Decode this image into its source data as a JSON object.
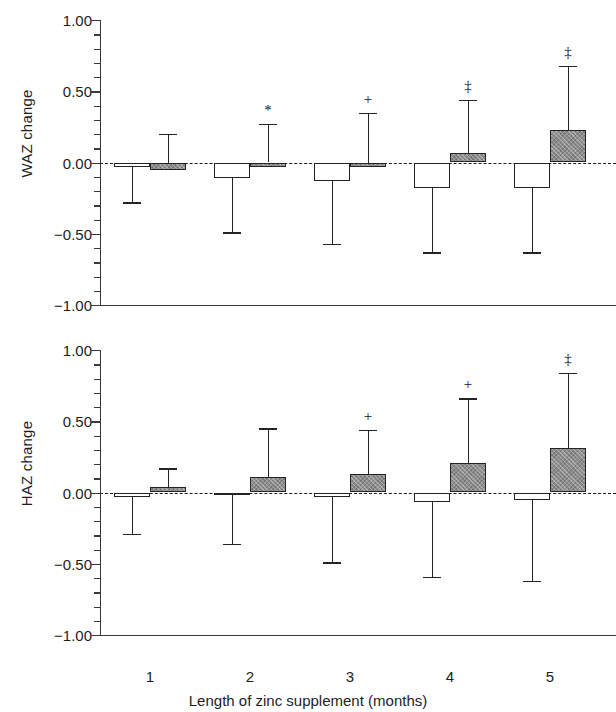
{
  "chart_data": [
    {
      "type": "bar",
      "panel_id": "waz",
      "title": "",
      "ylabel": "WAZ change",
      "xlabel": "",
      "ylim": [
        -1.0,
        1.0
      ],
      "ytick_labels": [
        "1.00",
        "0.50",
        "0.00",
        "-0.50",
        "-1.00"
      ],
      "ytick_values": [
        1.0,
        0.5,
        0.0,
        -0.5,
        -1.0
      ],
      "minor_tick_step": 0.1,
      "grid": false,
      "zero_reference_line": true,
      "legend_position": "none",
      "categories": [
        "1",
        "2",
        "3",
        "4",
        "5"
      ],
      "series": [
        {
          "name": "control",
          "fill": "white",
          "values": [
            -0.03,
            -0.11,
            -0.13,
            -0.18,
            -0.18
          ],
          "error_low": [
            -0.28,
            -0.49,
            -0.57,
            -0.63,
            -0.63
          ],
          "error_high": [
            null,
            null,
            null,
            null,
            null
          ],
          "significance": [
            "",
            "",
            "",
            "",
            ""
          ]
        },
        {
          "name": "zinc",
          "fill": "gray-hatched",
          "values": [
            -0.05,
            -0.02,
            0.0,
            0.07,
            0.23
          ],
          "error_low": [
            null,
            null,
            null,
            null,
            null
          ],
          "error_high": [
            0.2,
            0.27,
            0.35,
            0.44,
            0.68
          ],
          "significance": [
            "",
            "*",
            "+",
            "‡",
            "‡"
          ]
        }
      ]
    },
    {
      "type": "bar",
      "panel_id": "haz",
      "title": "",
      "ylabel": "HAZ change",
      "xlabel": "Length of zinc supplement (months)",
      "ylim": [
        -1.0,
        1.0
      ],
      "ytick_labels": [
        "1.00",
        "0.50",
        "0.00",
        "-0.50",
        "-1.00"
      ],
      "ytick_values": [
        1.0,
        0.5,
        0.0,
        -0.5,
        -1.0
      ],
      "minor_tick_step": 0.1,
      "grid": false,
      "zero_reference_line": true,
      "legend_position": "none",
      "categories": [
        "1",
        "2",
        "3",
        "4",
        "5"
      ],
      "series": [
        {
          "name": "control",
          "fill": "white",
          "values": [
            -0.03,
            -0.005,
            -0.03,
            -0.07,
            -0.05
          ],
          "error_low": [
            -0.29,
            -0.36,
            -0.49,
            -0.59,
            -0.62
          ],
          "error_high": [
            null,
            null,
            null,
            null,
            null
          ],
          "significance": [
            "",
            "",
            "",
            "",
            ""
          ]
        },
        {
          "name": "zinc",
          "fill": "gray-hatched",
          "values": [
            0.04,
            0.11,
            0.13,
            0.21,
            0.31
          ],
          "error_low": [
            null,
            null,
            null,
            null,
            null
          ],
          "error_high": [
            0.17,
            0.45,
            0.44,
            0.66,
            0.84
          ],
          "significance": [
            "",
            "",
            "+",
            "+",
            "‡"
          ]
        }
      ]
    }
  ],
  "panels": {
    "waz": {
      "ylabel": "WAZ change"
    },
    "haz": {
      "ylabel": "HAZ change"
    }
  },
  "xaxis": {
    "title": "Length of zinc supplement (months)",
    "tick_labels": [
      "1",
      "2",
      "3",
      "4",
      "5"
    ]
  },
  "colors": {
    "control_fill": "#ffffff",
    "zinc_fill": "#8d8d8d",
    "outline": "#242424",
    "axis": "#3a3a3a",
    "text": "#1d1d1d"
  }
}
